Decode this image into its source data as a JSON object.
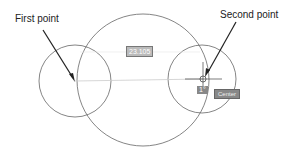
{
  "annotations": {
    "first_point": "First point",
    "second_point": "Second point"
  },
  "dimension_input": {
    "value": "23.105"
  },
  "angle_input": {
    "value": "1°"
  },
  "snap_tooltip": {
    "label": "Center"
  },
  "colors": {
    "stroke": "#555555",
    "guide": "#cccccc",
    "arrow": "#222222"
  }
}
